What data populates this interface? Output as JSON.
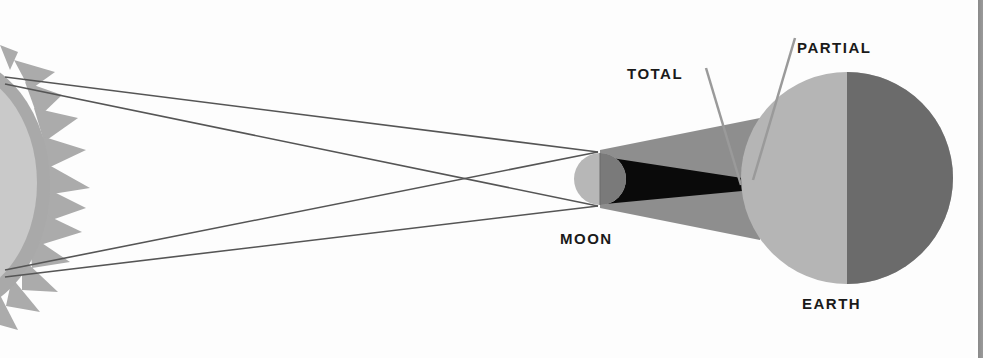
{
  "diagram": {
    "labels": {
      "total": "TOTAL",
      "partial": "PARTIAL",
      "moon": "MOON",
      "earth": "EARTH"
    },
    "bodies": [
      {
        "name": "Sun",
        "shape": "sun-with-rays",
        "color_disc": "#c8c8c8",
        "color_rays": "#a8a8a8",
        "position": "left edge, partially cropped"
      },
      {
        "name": "Moon",
        "shape": "circle",
        "color_lit": "#b8b8b8",
        "color_shadow": "#7a7a7a"
      },
      {
        "name": "Earth",
        "shape": "circle",
        "color_day": "#b5b5b5",
        "color_night": "#6b6b6b"
      }
    ],
    "shadows": [
      {
        "name": "umbra",
        "meaning": "total eclipse region",
        "color": "#0a0a0a"
      },
      {
        "name": "penumbra",
        "meaning": "partial eclipse region",
        "color": "#8f8f8f"
      }
    ],
    "rays": {
      "count": 4,
      "color": "#555555",
      "description": "tangent lines from sun's top and bottom edges to moon, crossing between sun and moon"
    },
    "colors": {
      "background": "#fdfdfd",
      "text": "#1a1a1a",
      "pointer_line": "#9a9a9a"
    }
  }
}
